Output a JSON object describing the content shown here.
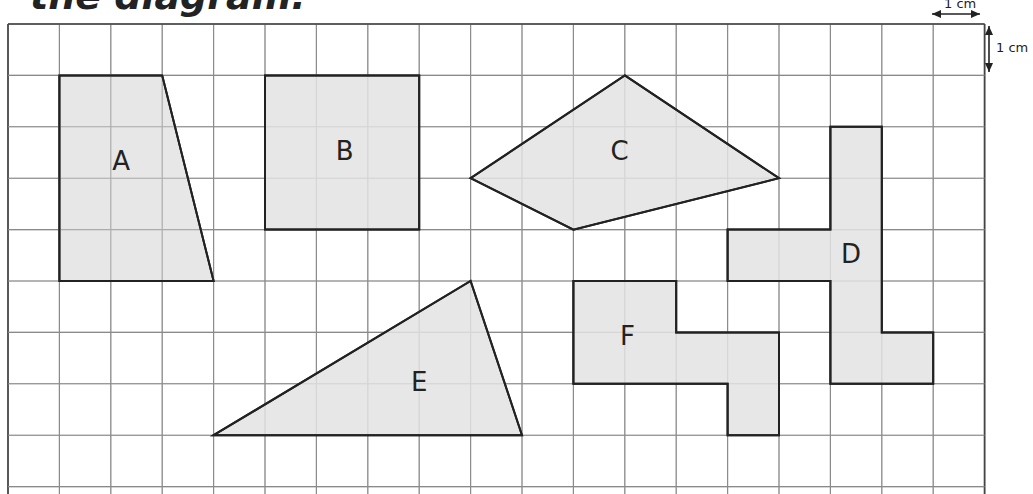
{
  "title": "the diagram.",
  "grid": {
    "origin_x": 8,
    "origin_y": 24,
    "cell": 51.4,
    "cols": 19,
    "rows": 9,
    "line_color": "#8a8a8a",
    "border_color": "#444444"
  },
  "scale": {
    "horizontal_label": "1 cm",
    "vertical_label": "1 cm"
  },
  "shape_style": {
    "fill": "#e3e3e3",
    "stroke": "#222222"
  },
  "shapes": [
    {
      "label": "A",
      "type": "trapezoid",
      "points": [
        [
          1,
          1
        ],
        [
          3,
          1
        ],
        [
          4,
          5
        ],
        [
          1,
          5
        ]
      ],
      "label_pos": [
        2.2,
        2.7
      ]
    },
    {
      "label": "B",
      "type": "square",
      "points": [
        [
          5,
          1
        ],
        [
          8,
          1
        ],
        [
          8,
          4
        ],
        [
          5,
          4
        ]
      ],
      "label_pos": [
        6.55,
        2.5
      ]
    },
    {
      "label": "C",
      "type": "kite",
      "points": [
        [
          12,
          1
        ],
        [
          15,
          3
        ],
        [
          11,
          4
        ],
        [
          9,
          3
        ]
      ],
      "label_pos": [
        11.9,
        2.5
      ]
    },
    {
      "label": "D",
      "type": "polyomino",
      "points": [
        [
          16,
          2
        ],
        [
          17,
          2
        ],
        [
          17,
          6
        ],
        [
          18,
          6
        ],
        [
          18,
          7
        ],
        [
          16,
          7
        ],
        [
          16,
          5
        ],
        [
          14,
          5
        ],
        [
          14,
          4
        ],
        [
          16,
          4
        ]
      ],
      "label_pos": [
        16.4,
        4.5
      ]
    },
    {
      "label": "E",
      "type": "triangle",
      "points": [
        [
          4,
          8
        ],
        [
          9,
          5
        ],
        [
          10,
          8
        ]
      ],
      "label_pos": [
        8.0,
        7.0
      ]
    },
    {
      "label": "F",
      "type": "polyomino",
      "points": [
        [
          11,
          5
        ],
        [
          13,
          5
        ],
        [
          13,
          6
        ],
        [
          15,
          6
        ],
        [
          15,
          8
        ],
        [
          14,
          8
        ],
        [
          14,
          7
        ],
        [
          11,
          7
        ]
      ],
      "label_pos": [
        12.05,
        6.1
      ]
    }
  ]
}
